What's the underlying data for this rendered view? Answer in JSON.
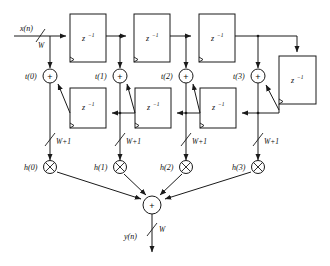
{
  "diagram": {
    "signals": {
      "input_label": "x(n)",
      "output_label": "y(n)",
      "input_width": "W",
      "output_width": "W",
      "tap_width": "W+1"
    },
    "delay_symbol": "z",
    "delay_exponent": "−1",
    "adder_symbol": "+",
    "multiplier_symbol": "⊗",
    "top_delays": [
      {
        "name": "top-delay-0",
        "label": "z",
        "exp": "−1"
      },
      {
        "name": "top-delay-1",
        "label": "z",
        "exp": "−1"
      },
      {
        "name": "top-delay-2",
        "label": "z",
        "exp": "−1"
      }
    ],
    "feedback_delay": {
      "name": "feedback-delay",
      "label": "z",
      "exp": "−1"
    },
    "bottom_delays": [
      {
        "name": "bottom-delay-0",
        "label": "z",
        "exp": "−1"
      },
      {
        "name": "bottom-delay-1",
        "label": "z",
        "exp": "−1"
      },
      {
        "name": "bottom-delay-2",
        "label": "z",
        "exp": "−1"
      }
    ],
    "taps": [
      {
        "node": "t(0)",
        "coeff": "h(0)",
        "width": "W+1"
      },
      {
        "node": "t(1)",
        "coeff": "h(1)",
        "width": "W+1"
      },
      {
        "node": "t(2)",
        "coeff": "h(2)",
        "width": "W+1"
      },
      {
        "node": "t(3)",
        "coeff": "h(3)",
        "width": "W+1"
      }
    ],
    "output_adder": {
      "name": "output-adder",
      "symbol": "+"
    }
  }
}
